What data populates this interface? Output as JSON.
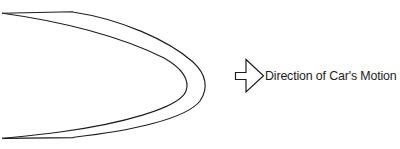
{
  "figure": {
    "type": "technical-diagram",
    "background_color": "#ffffff",
    "stroke_color": "#1d1d1d"
  },
  "road": {
    "name": "hairpin-curve",
    "outer_edge_path": "M 2.5 13.2 L 72.5 11.8 L 74 12.2 C 120 19 168 40 193 62 C 206 74 209 88 200 101 C 186 119 130 131 74 137.2 L 73.5 137.6 L 2.5 138.4",
    "inner_edge_path": "M 2.5 13.2 C 60 21 120 36 164 58 C 182 68 190 80 186 91 C 180 108 120 124 60 132 C 38 135 16 137 2.5 138.4",
    "edge_count": 2,
    "stroke_width": 1.15
  },
  "annotation": {
    "arrow": {
      "name": "direction-arrow",
      "points": "235.5,72.5 246,72.5 246,59.5 263.5,75.8 246,92 246,79.5 235.5,79.5",
      "direction": "right",
      "fill": "#ffffff"
    },
    "label": {
      "text": "Direction of Car's Motion",
      "x": 265,
      "y": 80,
      "font_size": "12.4px",
      "color": "#1d1d1d"
    }
  }
}
